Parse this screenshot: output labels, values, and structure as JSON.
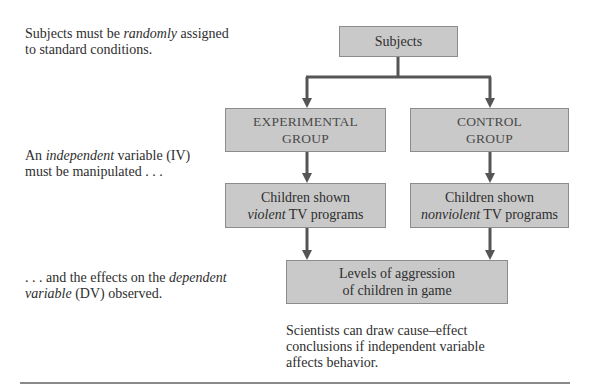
{
  "notes": {
    "random": {
      "pre": "Subjects must be ",
      "em": "randomly",
      "post": " assigned",
      "line2": "to standard conditions."
    },
    "iv": {
      "pre": "An ",
      "em": "independent",
      "post": " variable (IV)",
      "line2": "must be manipulated . . ."
    },
    "dv": {
      "line1_pre": ". . .  and the effects on the ",
      "line1_em": "dependent",
      "line2_em": "variable",
      "line2_post": " (DV) observed."
    },
    "conclusion": {
      "line1": "Scientists can draw cause–effect",
      "line2": "conclusions if independent variable",
      "line3": "affects behavior."
    }
  },
  "boxes": {
    "subjects": "Subjects",
    "experimental": {
      "line1": "EXPERIMENTAL",
      "line2": "GROUP"
    },
    "control": {
      "line1": "CONTROL",
      "line2": "GROUP"
    },
    "violent": {
      "line1": "Children shown",
      "line2_em": "violent",
      "line2_post": " TV programs"
    },
    "nonviolent": {
      "line1": "Children shown",
      "line2_em": "nonviolent",
      "line2_post": " TV programs"
    },
    "outcome": {
      "line1": "Levels of aggression",
      "line2": "of children in game"
    }
  },
  "colors": {
    "box_fill": "#c9c9c9",
    "box_border": "#8c8c8c",
    "arrow": "#555555",
    "text": "#2e2e2e"
  }
}
